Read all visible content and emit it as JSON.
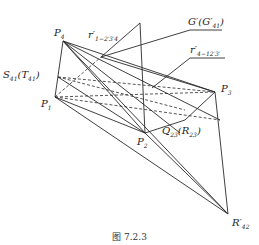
{
  "figure": {
    "caption": "图 7.2.3",
    "labels": {
      "P4": {
        "base": "P",
        "sub": "4"
      },
      "P1": {
        "base": "P",
        "sub": "1"
      },
      "P2": {
        "base": "P",
        "sub": "2"
      },
      "P3": {
        "base": "P",
        "sub": "3"
      },
      "S41": {
        "text": "S",
        "sub": "41",
        "paren_text": "T",
        "paren_sub": "41"
      },
      "Q23": {
        "text": "Q",
        "sub": "23",
        "paren_text": "R",
        "paren_sub": "23"
      },
      "G": {
        "text": "G′",
        "paren_text": "G′",
        "paren_sub": "41"
      },
      "r1": {
        "text": "r′",
        "sub": "1−2′3′4"
      },
      "r4": {
        "text": "r′",
        "sub": "4−12′3′"
      },
      "R42": {
        "text": "R′",
        "sub": "42"
      }
    }
  },
  "points": {
    "P4": [
      63,
      41
    ],
    "P1": [
      55,
      97
    ],
    "S41": [
      58,
      77
    ],
    "P2": [
      145,
      133
    ],
    "P3": [
      215,
      92
    ],
    "R42": [
      228,
      214
    ],
    "Apex": [
      140,
      23
    ],
    "r1pt": [
      101,
      57
    ],
    "Q23": [
      185,
      125
    ]
  },
  "colors": {
    "line": "#2a2a2a",
    "text": "#222222"
  }
}
